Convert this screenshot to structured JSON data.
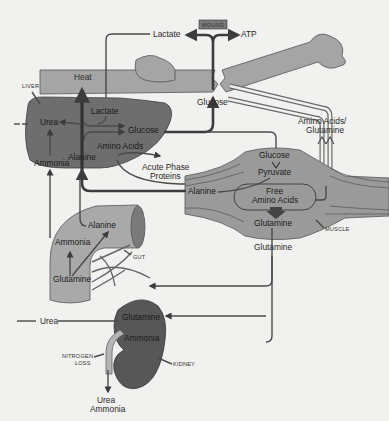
{
  "diagram": {
    "type": "metabolic-flow",
    "colors": {
      "background": "#f1f1ef",
      "liver": "#6e6e6e",
      "muscle": "#9a9a9a",
      "gut": "#a9a9a9",
      "kidney": "#575757",
      "bone": "#a5a5a5",
      "line": "#4a4a4a"
    },
    "wound": {
      "label": "WOUND"
    },
    "top": {
      "lactate": "Lactate",
      "atp": "ATP",
      "glucose": "Glucose"
    },
    "liver": {
      "caption": "LIVER",
      "heat": "Heat",
      "lactate": "Lactate",
      "urea": "Urea",
      "glucose": "Glucose",
      "amino_acids": "Amino Acids",
      "ammonia": "Ammonia",
      "alanine": "Alanine"
    },
    "acute_phase": {
      "line1": "Acute Phase",
      "line2": "Proteins"
    },
    "amino_glutamine": {
      "line1": "Amino Acids/",
      "line2": "Glutamine"
    },
    "muscle": {
      "caption": "MUSCLE",
      "glucose": "Glucose",
      "pyruvate": "Pyruvate",
      "alanine": "Alanine",
      "free_line1": "Free",
      "free_line2": "Amino Acids",
      "glutamine": "Glutamine"
    },
    "glutamine_transport": "Glutamine",
    "gut": {
      "caption": "GUT",
      "alanine": "Alanine",
      "ammonia": "Ammonia",
      "glutamine": "Glutamine"
    },
    "kidney": {
      "caption": "KIDNEY",
      "glutamine": "Glutamine",
      "ammonia": "Ammonia",
      "urea_in": "Urea",
      "nitrogen_line1": "NITROGEN",
      "nitrogen_line2": "LOSS",
      "out_line1": "Urea",
      "out_line2": "Ammonia"
    }
  }
}
